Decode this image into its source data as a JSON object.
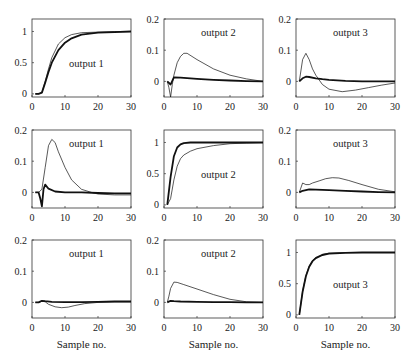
{
  "chart_data": {
    "type": "line",
    "layout": "3x3 grid of step-response subplots",
    "xlabel": "Sample no.",
    "xlim": [
      0,
      30
    ],
    "xticks": [
      0,
      10,
      20,
      30
    ],
    "legend": "none; thin line and thick line series in each panel",
    "panels": [
      {
        "row": 0,
        "col": 0,
        "label": "output 1",
        "ylim": [
          -0.05,
          1.2
        ],
        "yticks": [
          0,
          0.5,
          1
        ],
        "series": [
          {
            "name": "thin",
            "x": [
              1,
              2,
              3,
              4,
              5,
              6,
              8,
              10,
              12,
              15,
              20,
              25,
              30
            ],
            "y": [
              0,
              0,
              0.02,
              0.2,
              0.4,
              0.58,
              0.8,
              0.9,
              0.95,
              0.98,
              0.99,
              1,
              1
            ]
          },
          {
            "name": "thick",
            "x": [
              1,
              2,
              3,
              4,
              5,
              6,
              8,
              10,
              12,
              15,
              20,
              25,
              30
            ],
            "y": [
              0,
              0,
              0.02,
              0.18,
              0.35,
              0.5,
              0.7,
              0.82,
              0.89,
              0.95,
              0.98,
              0.99,
              1
            ]
          }
        ]
      },
      {
        "row": 0,
        "col": 1,
        "label": "output 2",
        "ylim": [
          -0.05,
          0.2
        ],
        "yticks": [
          0,
          0.1,
          0.2
        ],
        "series": [
          {
            "name": "thin",
            "x": [
              1,
              1.5,
              2,
              2.5,
              3,
              4,
              5,
              6,
              7,
              10,
              15,
              20,
              25,
              30
            ],
            "y": [
              0,
              -0.02,
              -0.05,
              -0.01,
              0.02,
              0.06,
              0.08,
              0.09,
              0.09,
              0.07,
              0.04,
              0.02,
              0.008,
              0
            ]
          },
          {
            "name": "thick",
            "x": [
              1,
              2,
              3,
              5,
              10,
              15,
              20,
              25,
              30
            ],
            "y": [
              0,
              -0.01,
              0.013,
              0.012,
              0.008,
              0.005,
              0.003,
              0.001,
              0
            ]
          }
        ]
      },
      {
        "row": 0,
        "col": 2,
        "label": "output 3",
        "ylim": [
          -0.05,
          0.2
        ],
        "yticks": [
          0,
          0.1,
          0.2
        ],
        "series": [
          {
            "name": "thin",
            "x": [
              1,
              2,
              3,
              4,
              5,
              6,
              8,
              10,
              14,
              18,
              22,
              26,
              30
            ],
            "y": [
              0,
              0.07,
              0.09,
              0.07,
              0.04,
              0.02,
              -0.01,
              -0.025,
              -0.033,
              -0.028,
              -0.02,
              -0.012,
              -0.005
            ]
          },
          {
            "name": "thick",
            "x": [
              1,
              2,
              3,
              4,
              6,
              8,
              10,
              15,
              20,
              25,
              30
            ],
            "y": [
              0,
              0.01,
              0.015,
              0.014,
              0.01,
              0.007,
              0.005,
              0.002,
              0,
              0,
              0
            ]
          }
        ]
      },
      {
        "row": 1,
        "col": 0,
        "label": "output 1",
        "ylim": [
          -0.05,
          0.2
        ],
        "yticks": [
          0,
          0.1,
          0.2
        ],
        "series": [
          {
            "name": "thin",
            "x": [
              1,
              2,
              3,
              4,
              5,
              6,
              7,
              8,
              10,
              12,
              15,
              18,
              20,
              25,
              30
            ],
            "y": [
              0,
              0,
              0.01,
              0.08,
              0.15,
              0.17,
              0.16,
              0.13,
              0.08,
              0.04,
              0.01,
              0,
              -0.005,
              -0.008,
              -0.008
            ]
          },
          {
            "name": "thick",
            "x": [
              1,
              2,
              2.5,
              3,
              3.5,
              4,
              5,
              7,
              10,
              15,
              20,
              25,
              30
            ],
            "y": [
              0,
              0,
              -0.02,
              -0.045,
              0.01,
              0.025,
              0.012,
              0.003,
              0,
              0,
              -0.002,
              -0.003,
              -0.003
            ]
          }
        ]
      },
      {
        "row": 1,
        "col": 1,
        "label": "output 2",
        "ylim": [
          -0.05,
          1.2
        ],
        "yticks": [
          0,
          0.5,
          1
        ],
        "series": [
          {
            "name": "thin",
            "x": [
              1,
              2,
              3,
              4,
              5,
              6,
              8,
              10,
              15,
              20,
              25,
              30
            ],
            "y": [
              0,
              0.1,
              0.4,
              0.62,
              0.74,
              0.8,
              0.86,
              0.9,
              0.95,
              0.98,
              0.99,
              1
            ]
          },
          {
            "name": "thick",
            "x": [
              1,
              2,
              3,
              4,
              5,
              6,
              8,
              10,
              15,
              20,
              30
            ],
            "y": [
              0,
              0.45,
              0.78,
              0.92,
              0.97,
              0.99,
              1,
              1,
              1,
              1,
              1
            ]
          }
        ]
      },
      {
        "row": 1,
        "col": 2,
        "label": "output 3",
        "ylim": [
          -0.05,
          0.2
        ],
        "yticks": [
          0,
          0.1,
          0.2
        ],
        "series": [
          {
            "name": "thin",
            "x": [
              1,
              2,
              3,
              4,
              5,
              7,
              9,
              11,
              13,
              16,
              20,
              25,
              30
            ],
            "y": [
              0,
              0.03,
              0.025,
              0.025,
              0.03,
              0.037,
              0.044,
              0.047,
              0.046,
              0.038,
              0.025,
              0.01,
              0.002
            ]
          },
          {
            "name": "thick",
            "x": [
              1,
              2,
              4,
              6,
              10,
              15,
              20,
              25,
              30
            ],
            "y": [
              0,
              0.005,
              0.01,
              0.009,
              0.007,
              0.005,
              0.003,
              0.001,
              0
            ]
          }
        ]
      },
      {
        "row": 2,
        "col": 0,
        "label": "output 1",
        "ylim": [
          -0.05,
          0.2
        ],
        "yticks": [
          0,
          0.1,
          0.2
        ],
        "series": [
          {
            "name": "thin",
            "x": [
              1,
              2,
              3,
              4,
              5,
              7,
              9,
              11,
              13,
              16,
              20,
              25,
              30
            ],
            "y": [
              0,
              0,
              0.004,
              0.002,
              -0.006,
              -0.014,
              -0.017,
              -0.015,
              -0.01,
              -0.004,
              0,
              0.002,
              0.002
            ]
          },
          {
            "name": "thick",
            "x": [
              1,
              2,
              3,
              4,
              6,
              10,
              15,
              20,
              25,
              30
            ],
            "y": [
              0,
              0,
              0.005,
              0.004,
              0.002,
              0.001,
              0.001,
              0.002,
              0.003,
              0.003
            ]
          }
        ]
      },
      {
        "row": 2,
        "col": 1,
        "label": "output 2",
        "ylim": [
          -0.05,
          0.2
        ],
        "yticks": [
          0,
          0.1,
          0.2
        ],
        "series": [
          {
            "name": "thin",
            "x": [
              1,
              1.5,
              2,
              3,
              4,
              6,
              10,
              15,
              20,
              25,
              30
            ],
            "y": [
              0,
              0.02,
              0.045,
              0.065,
              0.064,
              0.057,
              0.043,
              0.025,
              0.01,
              0.002,
              0
            ]
          },
          {
            "name": "thick",
            "x": [
              1,
              2,
              3,
              5,
              10,
              15,
              20,
              25,
              30
            ],
            "y": [
              0,
              0.005,
              0.004,
              0.003,
              0.002,
              0.001,
              0.001,
              0,
              0
            ]
          }
        ]
      },
      {
        "row": 2,
        "col": 2,
        "label": "output 3",
        "ylim": [
          -0.05,
          1.2
        ],
        "yticks": [
          0,
          0.5,
          1
        ],
        "series": [
          {
            "name": "thin",
            "x": [
              1,
              2,
              3,
              4,
              5,
              6,
              8,
              10,
              15,
              20,
              30
            ],
            "y": [
              0,
              0.38,
              0.63,
              0.78,
              0.87,
              0.92,
              0.97,
              0.99,
              1,
              1,
              1
            ]
          },
          {
            "name": "thick",
            "x": [
              1,
              2,
              3,
              4,
              5,
              6,
              8,
              10,
              15,
              20,
              30
            ],
            "y": [
              0,
              0.37,
              0.62,
              0.77,
              0.86,
              0.91,
              0.96,
              0.98,
              0.995,
              1,
              1
            ]
          }
        ]
      }
    ]
  }
}
